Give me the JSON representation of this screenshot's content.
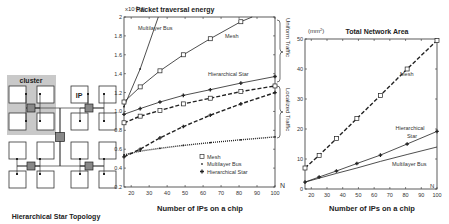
{
  "diagram": {
    "cluster_label": "cluster",
    "ip_label": "IP",
    "caption": "Hierarchical Star Topology"
  },
  "chart_data": [
    {
      "type": "line",
      "title": "Packet traversal energy",
      "y_unit": "x10^-9 (J)",
      "y_unit_prefix": "x10",
      "y_unit_exp": "-9",
      "y_unit_suffix": "(J)",
      "xlabel": "Number of IPs on a chip",
      "x_axis_end_label": "N",
      "ylim": [
        0.2,
        2.0
      ],
      "xlim": [
        16,
        100
      ],
      "xticks": [
        20,
        30,
        40,
        50,
        60,
        70,
        80,
        90,
        100
      ],
      "yticks": [
        0.2,
        0.4,
        0.6,
        0.8,
        1.0,
        1.2,
        1.4,
        1.6,
        1.8,
        2.0
      ],
      "ytick_labels": [
        "0.2",
        "0.4",
        "0.6",
        "0.8",
        "1.0",
        "1.2",
        "1.4",
        "1.6",
        "1.8",
        "2"
      ],
      "x": [
        16,
        25,
        36,
        49,
        64,
        81,
        100
      ],
      "series": [
        {
          "name": "Multilayer Bus (uniform)",
          "style": "solid",
          "marker": "dot",
          "values": [
            1.05,
            1.45,
            2.05,
            null,
            null,
            null,
            null
          ]
        },
        {
          "name": "Mesh (uniform)",
          "style": "solid",
          "marker": "square",
          "values": [
            1.1,
            1.26,
            1.43,
            1.6,
            1.77,
            1.95,
            2.1
          ]
        },
        {
          "name": "Hierarchical Star (uniform)",
          "style": "solid",
          "marker": "star",
          "values": [
            0.97,
            1.03,
            1.1,
            1.17,
            1.23,
            1.3,
            1.37
          ]
        },
        {
          "name": "Mesh (localized)",
          "style": "dashed",
          "marker": "square",
          "values": [
            0.88,
            0.95,
            1.01,
            1.08,
            1.14,
            1.21,
            1.27
          ]
        },
        {
          "name": "Hierarchical Star (localized)",
          "style": "dashed",
          "marker": "star",
          "values": [
            0.52,
            0.6,
            0.72,
            0.84,
            0.96,
            1.08,
            1.2
          ]
        },
        {
          "name": "Multilayer Bus (localized)",
          "style": "dotted",
          "marker": "dot",
          "values": [
            0.54,
            0.58,
            0.61,
            0.64,
            0.67,
            0.7,
            0.73
          ]
        }
      ],
      "annotations": {
        "multilayer_bus": "Multilayer Bus",
        "mesh": "Mesh",
        "hierarchical_star": "Hierarchical Star",
        "uniform_traffic": "Uniform Traffic",
        "localized_traffic": "Localized Traffic"
      },
      "legend": {
        "position": "lower right",
        "entries": [
          {
            "marker": "square",
            "label": "Mesh"
          },
          {
            "marker": "dot",
            "label": "Multilayer Bus"
          },
          {
            "marker": "star",
            "label": "Hierarchical Star"
          }
        ]
      },
      "grid": false
    },
    {
      "type": "line",
      "title": "Total Network Area",
      "y_unit": "(mm2)",
      "y_unit_prefix": "(mm",
      "y_unit_exp": "2",
      "y_unit_suffix": ")",
      "xlabel": "Number of IPs on a chip",
      "x_axis_end_label": "N",
      "ylim": [
        0,
        50
      ],
      "xlim": [
        16,
        100
      ],
      "xticks": [
        20,
        30,
        40,
        50,
        60,
        70,
        80,
        90,
        100
      ],
      "yticks": [
        0,
        10,
        20,
        30,
        40,
        50
      ],
      "ytick_labels": [
        "0",
        "10",
        "20",
        "30",
        "40",
        "50"
      ],
      "x": [
        16,
        25,
        36,
        49,
        64,
        81,
        100
      ],
      "series": [
        {
          "name": "Mesh",
          "style": "dashed",
          "marker": "square",
          "values": [
            7,
            11.2,
            16.8,
            23.5,
            31.2,
            40,
            49.5
          ]
        },
        {
          "name": "Hierarchical Star",
          "style": "solid",
          "marker": "star",
          "values": [
            2.3,
            4,
            6,
            8.5,
            11.3,
            15,
            19.2
          ]
        },
        {
          "name": "Multilayer Bus",
          "style": "solid",
          "marker": "none",
          "values": [
            2.3,
            3.6,
            5.2,
            7,
            9.2,
            11.5,
            14
          ]
        }
      ],
      "annotations": {
        "mesh": "Mesh",
        "hierarchical_star_1": "Hierarchical",
        "hierarchical_star_2": "Star",
        "multilayer_bus": "Multilayer Bus"
      },
      "grid": false
    }
  ]
}
